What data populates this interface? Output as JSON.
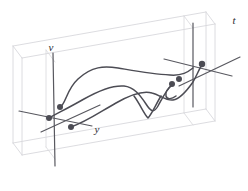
{
  "figure": {
    "kind": "3d-box-trajectory-diagram",
    "title": "",
    "background_color": "#ffffff",
    "box_edge_color": "#d8d8dc",
    "axis_line_color": "#58585f",
    "curve_color": "#4c4c54",
    "dot_color": "#4c4c54",
    "box": {
      "front_bottom_left": [
        22,
        155
      ],
      "front_bottom_right": [
        215,
        121
      ],
      "front_top_left": [
        22,
        58
      ],
      "front_top_right": [
        215,
        24
      ],
      "back_bottom_left": [
        13,
        143
      ],
      "back_bottom_right": [
        206,
        109
      ],
      "back_top_left": [
        13,
        46
      ],
      "back_top_right": [
        206,
        12
      ],
      "depth_offset": [
        -9,
        -12
      ]
    },
    "labels": [
      {
        "name": "v-axis-label",
        "text": "v",
        "x": 51,
        "y": 51
      },
      {
        "name": "t-axis-label",
        "text": "t",
        "x": 234,
        "y": 24
      },
      {
        "name": "y-axis-label",
        "text": "y",
        "x": 97,
        "y": 133
      }
    ],
    "vertical_axes": [
      {
        "name": "left-vertical-axis",
        "x1": 53,
        "y1": 53,
        "x2": 55,
        "y2": 166
      },
      {
        "name": "right-vertical-axis",
        "x1": 193,
        "y1": 23,
        "x2": 193,
        "y2": 107
      }
    ],
    "horizontal_axes": [
      {
        "name": "left-horizontal-axis",
        "x1": 19,
        "y1": 111,
        "x2": 92,
        "y2": 126
      },
      {
        "name": "right-horizontal-axis",
        "x1": 164,
        "y1": 59,
        "x2": 232,
        "y2": 76
      }
    ],
    "oblique_axes": [
      {
        "name": "left-depth-axis",
        "x1": 41,
        "y1": 132,
        "x2": 100,
        "y2": 105
      },
      {
        "name": "right-depth-axis",
        "x1": 179,
        "y1": 86,
        "x2": 240,
        "y2": 57
      }
    ],
    "markers": [
      {
        "name": "marker-1",
        "x": 60,
        "y": 107,
        "r": 3
      },
      {
        "name": "marker-2",
        "x": 49,
        "y": 118,
        "r": 3
      },
      {
        "name": "marker-3",
        "x": 71,
        "y": 127,
        "r": 3
      },
      {
        "name": "marker-4",
        "x": 179,
        "y": 79,
        "r": 3
      },
      {
        "name": "marker-5",
        "x": 172,
        "y": 84,
        "r": 3
      },
      {
        "name": "marker-6",
        "x": 202,
        "y": 64,
        "r": 3.2
      }
    ],
    "curves": [
      {
        "name": "curve-upper",
        "path": "M 60 107 C 66 104 66 90 78 79 C 92 66 104 66 118 68 C 136 71 152 74 170 75 C 182 76 188 72 193 68",
        "width": 1.5
      },
      {
        "name": "curve-middle",
        "path": "M 49 118 C 58 113 70 107 84 99 C 98 91 112 85 124 86 C 134 87 140 95 146 104 C 151 112 154 113 158 106 C 162 99 166 90 172 85",
        "width": 1.5
      },
      {
        "name": "curve-lower",
        "path": "M 71 127 C 86 122 100 112 116 103 C 130 95 142 90 152 93 C 160 95 166 101 173 100 C 180 99 186 92 193 82 C 197 75 199 69 202 65",
        "width": 1.5
      },
      {
        "name": "curve-stub",
        "path": "M 172 85 C 168 88 165 92 166 96 C 167 100 172 99 176 96",
        "width": 1.5
      },
      {
        "name": "curve-valley",
        "path": "M 134 96 C 140 104 144 114 148 118 C 152 114 156 104 161 96",
        "width": 1.5
      }
    ]
  }
}
